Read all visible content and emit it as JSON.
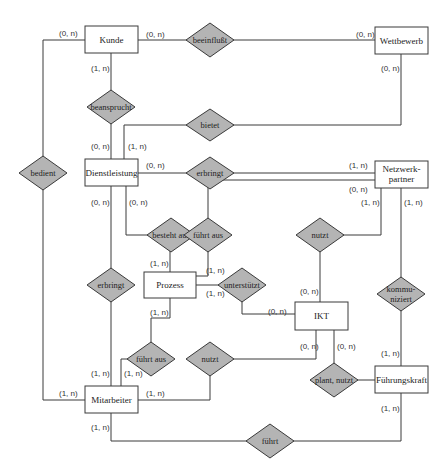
{
  "diagram": {
    "type": "entity-relationship",
    "colors": {
      "entity_fill": "#ffffff",
      "relationship_fill": "#b4b4b4",
      "stroke": "#3a3a3a",
      "background": "#ffffff"
    },
    "entities": [
      {
        "id": "kunde",
        "label": "Kunde"
      },
      {
        "id": "wettbewerb",
        "label": "Wettbewerb"
      },
      {
        "id": "dienstleistung",
        "label": "Dienstleistung"
      },
      {
        "id": "netzwerkpartner",
        "label_line1": "Netzwerk-",
        "label_line2": "partner"
      },
      {
        "id": "prozess",
        "label": "Prozess"
      },
      {
        "id": "ikt",
        "label": "IKT"
      },
      {
        "id": "mitarbeiter",
        "label": "Mitarbeiter"
      },
      {
        "id": "fuehrungskraft",
        "label": "Führungskraft"
      }
    ],
    "relationships": [
      {
        "id": "beeinflusst",
        "label": "beeinflußt"
      },
      {
        "id": "beansprucht",
        "label": "beansprucht"
      },
      {
        "id": "bietet",
        "label": "bietet"
      },
      {
        "id": "bedient",
        "label": "bedient"
      },
      {
        "id": "erbringt_np",
        "label": "erbringt"
      },
      {
        "id": "besteht_aus",
        "label": "besteht aus"
      },
      {
        "id": "fuehrt_aus_np",
        "label": "führt aus"
      },
      {
        "id": "nutzt_np",
        "label": "nutzt"
      },
      {
        "id": "erbringt_ma",
        "label": "erbringt"
      },
      {
        "id": "unterstuetzt",
        "label": "unterstützt"
      },
      {
        "id": "kommuniziert",
        "label_line1": "kommu-",
        "label_line2": "niziert"
      },
      {
        "id": "fuehrt_aus_ma",
        "label": "führt aus"
      },
      {
        "id": "nutzt_ma",
        "label": "nutzt"
      },
      {
        "id": "plant_nutzt",
        "label": "plant, nutzt"
      },
      {
        "id": "fuehrt",
        "label": "führt"
      }
    ],
    "cardinalities": {
      "kunde_beeinflusst": "(0, n)",
      "wettbewerb_beeinflusst": "(0, n)",
      "kunde_bedient": "(0, n)",
      "kunde_beansprucht": "(1, n)",
      "wettbewerb_bietet": "(0, n)",
      "dienstleistung_beansprucht": "(0, n)",
      "dienstleistung_bietet": "(1, n)",
      "dienstleistung_erbringt_np": "(0, n)",
      "netzwerkpartner_erbringt": "(1, n)",
      "netzwerkpartner_fuehrt_aus": "(0, n)",
      "netzwerkpartner_nutzt": "(1, n)",
      "netzwerkpartner_kommuniziert": "(1, n)",
      "dienstleistung_erbringt_ma": "(0, n)",
      "dienstleistung_besteht_aus": "(0, n)",
      "prozess_besteht_aus": "(1, n)",
      "prozess_fuehrt_aus_np": "(1, n)",
      "prozess_unterstuetzt": "(1, n)",
      "prozess_fuehrt_aus_ma": "(1, n)",
      "ikt_unterstuetzt": "(0, n)",
      "ikt_nutzt_np": "(0, n)",
      "ikt_nutzt_ma": "(0, n)",
      "ikt_plant_nutzt": "(0, n)",
      "fuehrungskraft_kommuniziert": "(1, n)",
      "fuehrungskraft_fuehrt": "(1, n)",
      "mitarbeiter_erbringt": "(1, n)",
      "mitarbeiter_fuehrt_aus": "(1, n)",
      "mitarbeiter_bedient": "(1, n)",
      "mitarbeiter_nutzt": "(1, n)",
      "mitarbeiter_fuehrt": "(1, n)"
    }
  }
}
